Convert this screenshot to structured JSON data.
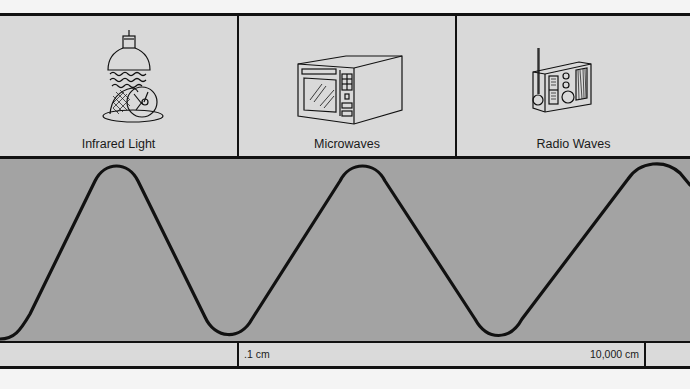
{
  "panels": [
    {
      "label": "Infrared Light",
      "icon": "heat-lamp-icon"
    },
    {
      "label": "Microwaves",
      "icon": "microwave-oven-icon"
    },
    {
      "label": "Radio Waves",
      "icon": "radio-icon"
    }
  ],
  "scale": {
    "left_label": ".1 cm",
    "right_label": "10,000 cm"
  },
  "colors": {
    "panel_bg": "#d9d9d9",
    "wave_bg": "#a3a3a3",
    "line": "#111111"
  },
  "wave": {
    "description": "sinusoidal electromagnetic wave",
    "peaks_x": [
      117,
      363,
      655
    ],
    "troughs_x": [
      0,
      230,
      498
    ]
  }
}
